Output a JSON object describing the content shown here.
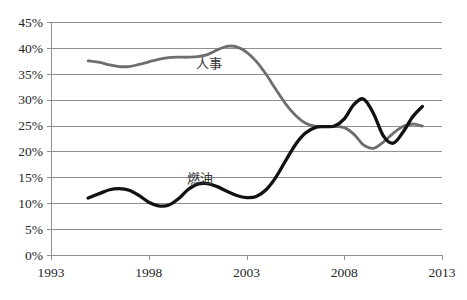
{
  "chart_data": {
    "type": "line",
    "title": "",
    "subtitle": "",
    "xlabel": "",
    "ylabel": "",
    "xlim": [
      1993,
      2013
    ],
    "ylim": [
      0,
      0.45
    ],
    "grid": true,
    "legend_position": "inline-annotation",
    "y_tick_labels": [
      "45%",
      "40%",
      "35%",
      "30%",
      "25%",
      "20%",
      "15%",
      "10%",
      "5%",
      "0%"
    ],
    "y_tick_values": [
      45,
      40,
      35,
      30,
      25,
      20,
      15,
      10,
      5,
      0
    ],
    "x_tick_labels": [
      "1993",
      "1998",
      "2003",
      "2008",
      "2013"
    ],
    "x_tick_values": [
      1993,
      1998,
      2003,
      2008,
      2013
    ],
    "series": [
      {
        "name": "人事",
        "label": "人事",
        "color": "#6e6e6e",
        "label_x": 2001.1,
        "label_y": 36.2,
        "x": [
          1994.9,
          1995.5,
          1996.0,
          1996.5,
          1997.0,
          1997.5,
          1998.0,
          1998.5,
          1999.0,
          1999.5,
          2000.0,
          2000.5,
          2001.0,
          2001.5,
          2002.0,
          2002.5,
          2003.0,
          2003.5,
          2004.0,
          2004.5,
          2005.0,
          2005.5,
          2006.0,
          2006.5,
          2007.0,
          2007.5,
          2008.0,
          2008.5,
          2009.0,
          2009.5,
          2010.0,
          2010.5,
          2011.0,
          2011.5,
          2012.0
        ],
        "values": [
          37.5,
          37.2,
          36.7,
          36.4,
          36.4,
          36.8,
          37.3,
          37.8,
          38.1,
          38.2,
          38.2,
          38.3,
          38.7,
          39.6,
          40.3,
          40.2,
          39.2,
          37.4,
          34.9,
          32.0,
          29.2,
          27.0,
          25.5,
          24.9,
          24.8,
          24.8,
          24.6,
          23.3,
          21.2,
          20.6,
          21.8,
          23.5,
          24.8,
          25.3,
          24.9
        ]
      },
      {
        "name": "燃油",
        "label": "燃油",
        "color": "#111111",
        "label_x": 2000.6,
        "label_y": 13.9,
        "x": [
          1994.9,
          1995.5,
          1996.0,
          1996.5,
          1997.0,
          1997.5,
          1998.0,
          1998.5,
          1999.0,
          1999.5,
          2000.0,
          2000.5,
          2001.0,
          2001.5,
          2002.0,
          2002.5,
          2003.0,
          2003.5,
          2004.0,
          2004.5,
          2005.0,
          2005.5,
          2006.0,
          2006.5,
          2007.0,
          2007.5,
          2008.0,
          2008.5,
          2009.0,
          2009.5,
          2010.0,
          2010.5,
          2011.0,
          2011.5,
          2012.0
        ],
        "values": [
          11.0,
          11.9,
          12.6,
          12.8,
          12.5,
          11.5,
          10.2,
          9.5,
          9.6,
          10.8,
          12.6,
          13.7,
          13.8,
          13.2,
          12.3,
          11.5,
          11.1,
          11.3,
          12.6,
          15.0,
          18.2,
          21.3,
          23.5,
          24.6,
          24.8,
          24.9,
          26.3,
          29.1,
          30.1,
          27.3,
          23.0,
          21.6,
          23.7,
          26.7,
          28.7
        ]
      }
    ],
    "final_points": [
      {
        "series": "燃油",
        "x": 2012.35,
        "value": 28.9
      },
      {
        "series": "人事",
        "x": 2012.35,
        "value": 24.0
      }
    ]
  },
  "geometry": {
    "plot_left": 51,
    "plot_right": 442,
    "plot_top": 22,
    "plot_bottom": 255
  }
}
